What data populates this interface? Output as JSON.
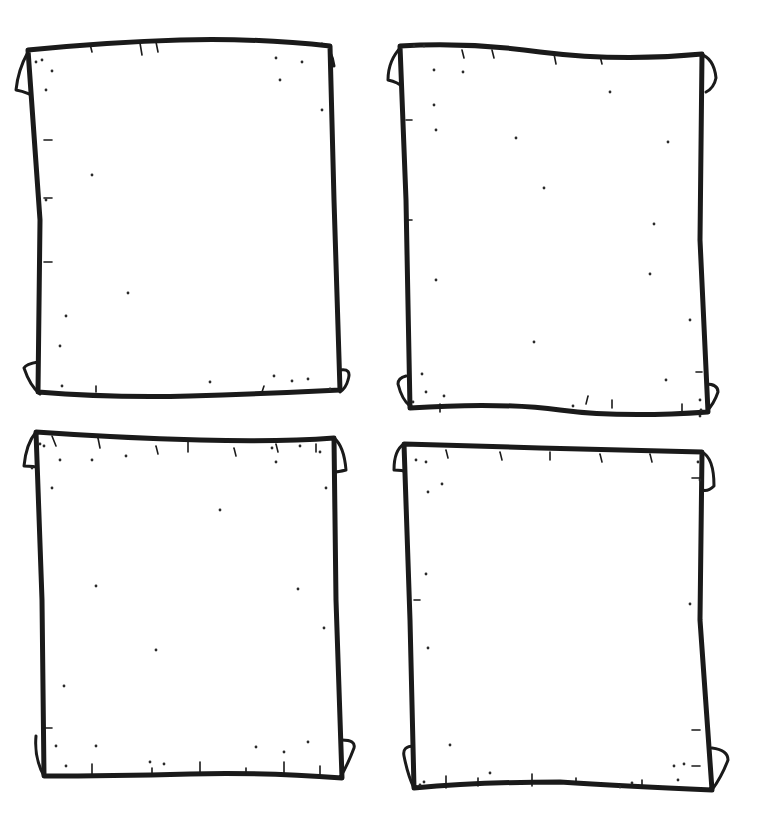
{
  "page": {
    "background": "#ffffff",
    "ink_color": "#1a1a1a"
  },
  "scrolls": [
    {
      "name": "scroll-top-left",
      "outline": "M28,50 Q110,42 180,40 Q260,38 330,46 L334,200 L340,390 Q260,394 190,396 Q110,398 38,392 L40,220 Z",
      "curls": [
        "M28,52 Q18,70 16,90 Q28,92 40,100",
        "M322,44 Q332,50 334,66",
        "M38,362 Q26,364 24,368 Q30,386 40,394",
        "M340,370 Q352,368 348,380 Q346,388 340,392"
      ],
      "ticks": [
        [
          90,
          44,
          92,
          52
        ],
        [
          140,
          43,
          142,
          55
        ],
        [
          156,
          42,
          158,
          52
        ],
        [
          44,
          140,
          52,
          140
        ],
        [
          44,
          198,
          52,
          198
        ],
        [
          44,
          262,
          52,
          262
        ],
        [
          96,
          392,
          96,
          386
        ],
        [
          262,
          392,
          264,
          386
        ]
      ],
      "specks": [
        [
          36,
          62
        ],
        [
          42,
          60
        ],
        [
          52,
          71
        ],
        [
          46,
          90
        ],
        [
          92,
          175
        ],
        [
          128,
          293
        ],
        [
          66,
          316
        ],
        [
          60,
          346
        ],
        [
          62,
          386
        ],
        [
          210,
          382
        ],
        [
          274,
          376
        ],
        [
          292,
          381
        ],
        [
          308,
          379
        ],
        [
          330,
          389
        ],
        [
          276,
          58
        ],
        [
          302,
          62
        ],
        [
          280,
          80
        ],
        [
          322,
          110
        ],
        [
          46,
          200
        ]
      ]
    },
    {
      "name": "scroll-top-right",
      "outline": "M400,46 Q470,42 540,52 Q620,62 702,54 L700,240 L708,412 Q620,418 560,410 Q500,402 410,408 L406,200 Z",
      "curls": [
        "M402,46 Q388,60 388,80 Q398,82 404,88",
        "M700,54 Q714,58 716,78 Q714,88 706,92",
        "M406,376 Q398,378 398,384 Q402,400 410,406",
        "M706,384 Q718,384 718,392 Q714,404 706,412"
      ],
      "ticks": [
        [
          462,
          50,
          464,
          58
        ],
        [
          492,
          50,
          494,
          58
        ],
        [
          554,
          54,
          556,
          64
        ],
        [
          600,
          56,
          602,
          64
        ],
        [
          406,
          120,
          412,
          120
        ],
        [
          406,
          220,
          412,
          220
        ],
        [
          440,
          412,
          440,
          404
        ],
        [
          586,
          404,
          588,
          396
        ],
        [
          612,
          408,
          612,
          400
        ],
        [
          682,
          412,
          682,
          404
        ],
        [
          696,
          372,
          702,
          372
        ]
      ],
      "specks": [
        [
          414,
          46
        ],
        [
          424,
          46
        ],
        [
          434,
          70
        ],
        [
          463,
          72
        ],
        [
          610,
          92
        ],
        [
          434,
          105
        ],
        [
          516,
          138
        ],
        [
          668,
          142
        ],
        [
          544,
          188
        ],
        [
          654,
          224
        ],
        [
          436,
          280
        ],
        [
          650,
          274
        ],
        [
          534,
          342
        ],
        [
          666,
          380
        ],
        [
          422,
          374
        ],
        [
          426,
          392
        ],
        [
          444,
          396
        ],
        [
          413,
          402
        ],
        [
          573,
          406
        ],
        [
          700,
          400
        ],
        [
          701,
          410
        ],
        [
          700,
          416
        ],
        [
          436,
          130
        ],
        [
          690,
          320
        ]
      ]
    },
    {
      "name": "scroll-bottom-left",
      "outline": "M36,432 Q120,438 200,440 Q280,442 334,438 L336,600 L342,778 Q260,772 190,774 Q110,776 44,776 L42,600 Z",
      "curls": [
        "M36,432 Q26,444 24,466 Q34,466 40,468",
        "M334,438 Q344,446 346,470 Q338,472 334,472",
        "M36,736 Q34,758 44,776",
        "M342,740 Q356,740 354,748 Q348,764 340,778"
      ],
      "ticks": [
        [
          52,
          436,
          56,
          446
        ],
        [
          98,
          438,
          100,
          448
        ],
        [
          156,
          446,
          158,
          454
        ],
        [
          188,
          442,
          188,
          452
        ],
        [
          234,
          448,
          236,
          456
        ],
        [
          276,
          444,
          278,
          452
        ],
        [
          316,
          444,
          316,
          452
        ],
        [
          92,
          774,
          92,
          764
        ],
        [
          152,
          774,
          152,
          768
        ],
        [
          200,
          774,
          200,
          762
        ],
        [
          246,
          774,
          246,
          768
        ],
        [
          284,
          774,
          284,
          762
        ],
        [
          320,
          776,
          320,
          766
        ],
        [
          42,
          728,
          52,
          728
        ]
      ],
      "specks": [
        [
          40,
          444
        ],
        [
          44,
          446
        ],
        [
          60,
          460
        ],
        [
          32,
          468
        ],
        [
          92,
          460
        ],
        [
          126,
          456
        ],
        [
          272,
          448
        ],
        [
          276,
          462
        ],
        [
          300,
          446
        ],
        [
          320,
          452
        ],
        [
          326,
          488
        ],
        [
          52,
          488
        ],
        [
          220,
          510
        ],
        [
          96,
          586
        ],
        [
          298,
          589
        ],
        [
          156,
          650
        ],
        [
          64,
          686
        ],
        [
          324,
          628
        ],
        [
          56,
          746
        ],
        [
          96,
          746
        ],
        [
          256,
          747
        ],
        [
          284,
          752
        ],
        [
          308,
          742
        ],
        [
          164,
          764
        ],
        [
          150,
          762
        ],
        [
          66,
          766
        ]
      ]
    },
    {
      "name": "scroll-bottom-right",
      "outline": "M404,444 Q470,446 540,448 Q620,450 702,452 L700,620 L712,790 Q620,786 560,782 Q480,782 414,788 L410,620 Z",
      "curls": [
        "M404,444 Q394,450 394,470 Q402,470 408,472",
        "M702,452 Q714,458 714,486 Q708,492 702,490",
        "M414,746 Q402,746 404,756 Q408,776 414,788",
        "M712,748 Q728,750 728,760 Q722,776 712,790"
      ],
      "ticks": [
        [
          446,
          450,
          448,
          458
        ],
        [
          500,
          452,
          502,
          460
        ],
        [
          550,
          452,
          550,
          460
        ],
        [
          600,
          454,
          602,
          462
        ],
        [
          650,
          454,
          652,
          462
        ],
        [
          700,
          478,
          692,
          478
        ],
        [
          414,
          600,
          420,
          600
        ],
        [
          446,
          788,
          446,
          776
        ],
        [
          478,
          786,
          478,
          778
        ],
        [
          532,
          786,
          532,
          774
        ],
        [
          576,
          784,
          576,
          778
        ],
        [
          642,
          788,
          642,
          780
        ],
        [
          700,
          730,
          692,
          730
        ],
        [
          700,
          766,
          692,
          766
        ]
      ],
      "specks": [
        [
          416,
          460
        ],
        [
          426,
          462
        ],
        [
          442,
          484
        ],
        [
          428,
          492
        ],
        [
          698,
          462
        ],
        [
          700,
          480
        ],
        [
          426,
          574
        ],
        [
          428,
          648
        ],
        [
          690,
          604
        ],
        [
          450,
          745
        ],
        [
          490,
          773
        ],
        [
          620,
          787
        ],
        [
          632,
          783
        ],
        [
          674,
          766
        ],
        [
          684,
          764
        ],
        [
          678,
          780
        ],
        [
          420,
          785
        ],
        [
          424,
          782
        ]
      ]
    }
  ]
}
